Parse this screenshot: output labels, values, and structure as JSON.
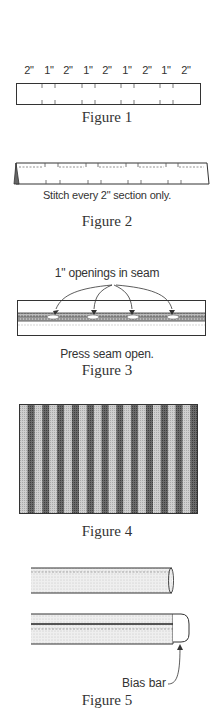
{
  "figure1": {
    "caption": "Figure 1",
    "labels": [
      {
        "text": "2\"",
        "x": 29
      },
      {
        "text": "1\"",
        "x": 49
      },
      {
        "text": "2\"",
        "x": 68
      },
      {
        "text": "1\"",
        "x": 88
      },
      {
        "text": "2\"",
        "x": 107
      },
      {
        "text": "1\"",
        "x": 127
      },
      {
        "text": "2\"",
        "x": 147
      },
      {
        "text": "1\"",
        "x": 166
      },
      {
        "text": "2\"",
        "x": 186
      }
    ]
  },
  "figure2": {
    "caption": "Figure 2",
    "note": "Stitch every 2\" section only."
  },
  "figure3": {
    "caption": "Figure 3",
    "callout": "1\" openings in seam",
    "note": "Press seam open.",
    "openings": 4
  },
  "figure4": {
    "caption": "Figure 4",
    "stripes": 24
  },
  "figure5": {
    "caption": "Figure 5",
    "callout": "Bias bar"
  },
  "colors": {
    "line": "#333333",
    "light_fabric": "#c8c8c8",
    "dark_fabric": "#5a5a5a",
    "tube_fill": "#ededed"
  }
}
